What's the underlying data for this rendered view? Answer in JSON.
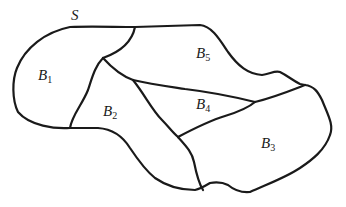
{
  "diagram": {
    "title_label": "S",
    "regions": [
      {
        "id": "B1",
        "main": "B",
        "sub": "1"
      },
      {
        "id": "B2",
        "main": "B",
        "sub": "2"
      },
      {
        "id": "B3",
        "main": "B",
        "sub": "3"
      },
      {
        "id": "B4",
        "main": "B",
        "sub": "4"
      },
      {
        "id": "B5",
        "main": "B",
        "sub": "5"
      }
    ],
    "stroke_color": "#1a1a1a",
    "background": "#ffffff"
  }
}
